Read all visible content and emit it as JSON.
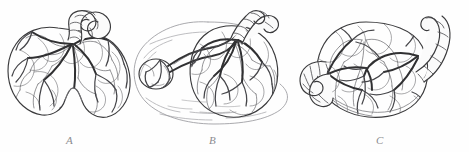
{
  "plate": {
    "caption_labels": [
      "A",
      "B",
      "C"
    ],
    "panels": [
      {
        "id": "A",
        "label": "A",
        "subject": "bilobed-placenta",
        "description": "Bilobed placenta, fetal surface, with coiled umbilical cord inserted near the upper margin and branching chorionic vessels radiating over two lobes",
        "cord_count": 1,
        "lobe_count": 2,
        "accessory_lobe": false,
        "membranes_shown": false
      },
      {
        "id": "B",
        "label": "B",
        "subject": "succenturiate-placenta",
        "description": "Placenta with succenturiate (accessory) lobe at left joined to the main disc by vessels running through the intervening membranes",
        "cord_count": 1,
        "lobe_count": 2,
        "accessory_lobe": true,
        "membranes_shown": true
      },
      {
        "id": "C",
        "label": "C",
        "subject": "twin-placenta",
        "description": "Fused twin placenta, fetal surface, bearing two umbilical cords, one curving upward at right and one hooking downward at left",
        "cord_count": 2,
        "lobe_count": 2,
        "accessory_lobe": false,
        "membranes_shown": false
      }
    ],
    "colors": {
      "background": "#fefefe",
      "ink": "#3a3a3c",
      "vessel": "#303032",
      "membrane": "#9a9a9e",
      "label": "#8c8c90",
      "disc_fill": "#f4f4f2"
    },
    "style": {
      "technique": "stippled line engraving",
      "label_style": "italic serif"
    }
  }
}
